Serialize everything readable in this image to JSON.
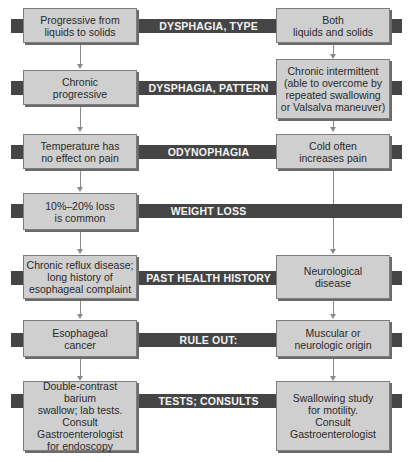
{
  "diagram": {
    "rows": [
      {
        "label": "DYSPHAGIA, TYPE",
        "left": "Progressive from\nliquids to solids",
        "right": "Both\nliquids and solids"
      },
      {
        "label": "DYSPHAGIA, PATTERN",
        "left": "Chronic\nprogressive",
        "right": "Chronic intermittent\n(able to overcome by\nrepeated swallowing\nor Valsalva maneuver)"
      },
      {
        "label": "ODYNOPHAGIA",
        "left": "Temperature has\nno effect on pain",
        "right": "Cold often\nincreases pain"
      },
      {
        "label": "WEIGHT LOSS",
        "left": "10%–20% loss\nis common",
        "right": null
      },
      {
        "label": "PAST HEALTH HISTORY",
        "left": "Chronic reflux disease;\nlong history of\nesophageal complaint",
        "right": "Neurological\ndisease"
      },
      {
        "label": "RULE OUT:",
        "left": "Esophageal\ncancer",
        "right": "Muscular or\nneurologic origin"
      },
      {
        "label": "TESTS; CONSULTS",
        "left": "Double-contrast barium\nswallow; lab tests.\nConsult\nGastroenterologist\nfor endoscopy",
        "right": "Swallowing study\nfor motility.\nConsult\nGastroenterologist"
      }
    ],
    "colors": {
      "bar": "#454545",
      "box": "#cfcfcf",
      "border": "#7d7d7d",
      "connector": "#8a8a8a"
    }
  }
}
